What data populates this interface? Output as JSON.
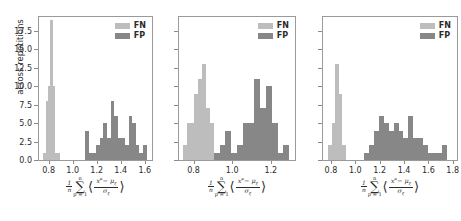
{
  "figure": {
    "ylabel": "across repetitions",
    "legend": {
      "fn_label": "FN",
      "fp_label": "FP"
    },
    "colors": {
      "fn": "#bdbdbd",
      "fp": "#878787",
      "axis": "#9a9a9a",
      "text": "#2b2b2b"
    }
  },
  "chart_data": [
    {
      "type": "bar",
      "title": "",
      "panel": 1,
      "xlabel": "(1/n) sum_{p=1}^{n} <(x^mu - mu_xi)/sigma_xi>",
      "ylabel": "across repetitions",
      "xlim": [
        0.72,
        1.66
      ],
      "ylim": [
        0,
        19.4
      ],
      "xticks": [
        0.8,
        1.0,
        1.2,
        1.4,
        1.6
      ],
      "yticks": [
        0.0,
        2.5,
        5.0,
        7.5,
        10.0,
        12.5,
        15.0,
        17.5
      ],
      "ytick_labels": [
        "0.0",
        "2.5",
        "5.0",
        "7.5",
        "10.0",
        "12.5",
        "15.0",
        "17.5"
      ],
      "xtick_labels": [
        "0.8",
        "1.0",
        "1.2",
        "1.4",
        "1.6"
      ],
      "grid": false,
      "legend_position": "upper right",
      "series": [
        {
          "name": "FN",
          "color": "#bdbdbd",
          "bin_edges": [
            0.755,
            0.775,
            0.795,
            0.815,
            0.835,
            0.855,
            0.875,
            0.895
          ],
          "values": [
            1,
            8,
            10,
            19,
            10,
            1,
            1
          ]
        },
        {
          "name": "FP",
          "color": "#878787",
          "bin_edges": [
            1.105,
            1.135,
            1.165,
            1.195,
            1.225,
            1.255,
            1.285,
            1.315,
            1.345,
            1.375,
            1.405,
            1.435,
            1.465,
            1.495,
            1.525,
            1.555,
            1.585,
            1.615
          ],
          "values": [
            4,
            1,
            1,
            2,
            3,
            5,
            3,
            8,
            6,
            3,
            3,
            2,
            6,
            5,
            2,
            1,
            2
          ]
        }
      ]
    },
    {
      "type": "bar",
      "title": "",
      "panel": 2,
      "xlabel": "(1/n) sum_{p=1}^{n} <(x^mu - mu_xi)/sigma_xi>",
      "ylabel": "",
      "xlim": [
        0.725,
        1.325
      ],
      "ylim": [
        0,
        19.4
      ],
      "xticks": [
        0.8,
        1.0,
        1.2
      ],
      "xtick_labels": [
        "0.8",
        "1.0",
        "1.2"
      ],
      "yticks": [
        0.0,
        2.5,
        5.0,
        7.5,
        10.0,
        12.5,
        15.0,
        17.5
      ],
      "grid": false,
      "legend_position": "upper right",
      "series": [
        {
          "name": "FN",
          "color": "#bdbdbd",
          "bin_edges": [
            0.745,
            0.765,
            0.785,
            0.805,
            0.825,
            0.845,
            0.865,
            0.885,
            0.905
          ],
          "values": [
            2,
            5,
            5,
            9,
            11,
            13,
            7,
            5
          ]
        },
        {
          "name": "FP",
          "color": "#878787",
          "bin_edges": [
            0.905,
            0.935,
            0.965,
            0.995,
            1.025,
            1.055,
            1.085,
            1.115,
            1.145,
            1.175,
            1.205,
            1.235,
            1.265,
            1.295
          ],
          "values": [
            1,
            2,
            4,
            1,
            2,
            5,
            5,
            11,
            7,
            10,
            5,
            1,
            2
          ]
        }
      ]
    },
    {
      "type": "bar",
      "title": "",
      "panel": 3,
      "xlabel": "(1/n) sum_{p=1}^{n} <(x^mu - mu_xi)/sigma_xi>",
      "ylabel": "",
      "xlim": [
        0.735,
        1.835
      ],
      "ylim": [
        0,
        19.4
      ],
      "xticks": [
        0.8,
        1.0,
        1.2,
        1.4,
        1.6,
        1.8
      ],
      "xtick_labels": [
        "0.8",
        "1.0",
        "1.2",
        "1.4",
        "1.6",
        "1.8"
      ],
      "yticks": [
        0.0,
        2.5,
        5.0,
        7.5,
        10.0,
        12.5,
        15.0,
        17.5
      ],
      "grid": false,
      "legend_position": "upper right",
      "series": [
        {
          "name": "FN",
          "color": "#bdbdbd",
          "bin_edges": [
            0.775,
            0.805,
            0.835,
            0.865,
            0.895,
            0.925
          ],
          "values": [
            2,
            5,
            13,
            9,
            2
          ]
        },
        {
          "name": "FP",
          "color": "#878787",
          "bin_edges": [
            1.075,
            1.115,
            1.155,
            1.195,
            1.235,
            1.275,
            1.315,
            1.355,
            1.395,
            1.435,
            1.475,
            1.515,
            1.555,
            1.595,
            1.715,
            1.755
          ],
          "values": [
            1,
            2,
            4,
            6,
            5,
            4,
            5,
            4,
            3,
            6,
            3,
            3,
            2,
            1,
            2
          ]
        }
      ]
    }
  ],
  "math_label": {
    "coef_num": "1",
    "coef_den": "n",
    "sum_upper": "n",
    "sum_lower": "p = 1",
    "sigma": "∑",
    "angle_open": "⟨",
    "angle_close": "⟩",
    "frac_num": "x",
    "frac_num_sup": "μ",
    "frac_num_minus": "− μ",
    "frac_num_sub": "ξ",
    "frac_den": "σ",
    "frac_den_sub": "ξ"
  }
}
